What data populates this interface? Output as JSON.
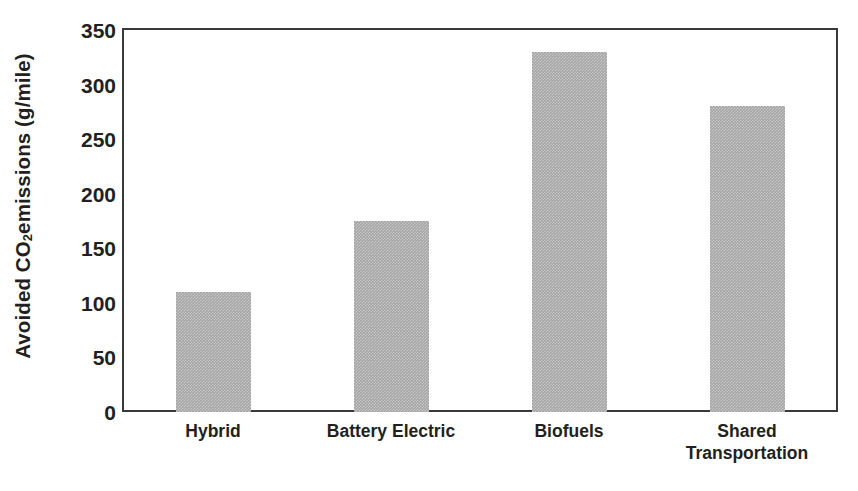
{
  "chart_data": {
    "type": "bar",
    "title": "",
    "xlabel": "",
    "ylabel": "Avoided CO2 emissions  (g/mile)",
    "ylabel_parts": {
      "before": "Avoided CO",
      "subscript": "2",
      "after": " emissions  (g/mile)"
    },
    "categories": [
      "Hybrid",
      "Battery Electric",
      "Biofuels",
      "Shared Transportation"
    ],
    "values": [
      110,
      175,
      330,
      280
    ],
    "ylim": [
      0,
      350
    ],
    "yticks": [
      0,
      50,
      100,
      150,
      200,
      250,
      300,
      350
    ],
    "ytick_labels": [
      "0",
      "50",
      "100",
      "150",
      "200",
      "250",
      "300",
      "350"
    ],
    "grid": false,
    "legend": false,
    "legend_position": "none",
    "bar_color": "#a3a3a3",
    "frame_color": "#3a3a3a",
    "text_color": "#231f20",
    "background_color": "#ffffff"
  }
}
